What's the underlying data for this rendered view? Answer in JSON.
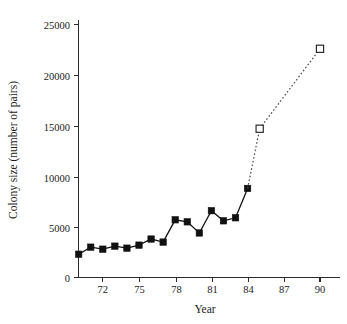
{
  "figure": {
    "background_color": "#ffffff",
    "axis_color": "#2b2b2b",
    "series_color": "#111111",
    "projected_color": "#4a4a4a"
  },
  "chart_data": {
    "type": "line",
    "title": "",
    "subtitle": "",
    "xlabel": "Year",
    "ylabel": "Colony size (number of pairs)",
    "xlim": [
      69.2,
      91.5
    ],
    "ylim": [
      0,
      26500
    ],
    "grid": false,
    "legend": null,
    "xticks": [
      72,
      75,
      78,
      81,
      84,
      87,
      90
    ],
    "xtick_labels": [
      "72",
      "75",
      "78",
      "81",
      "84",
      "87",
      "90"
    ],
    "yticks": [
      0,
      5000,
      10000,
      15000,
      20000,
      25000
    ],
    "ytick_labels": [
      "0",
      "5000",
      "10000",
      "15000",
      "20000",
      "25000"
    ],
    "series": [
      {
        "name": "Observed colony size",
        "marker": "filled-square",
        "linestyle": "solid",
        "x": [
          70,
          71,
          72,
          73,
          74,
          75,
          76,
          77,
          78,
          79,
          80,
          81,
          82,
          83,
          84
        ],
        "values": [
          2300,
          3000,
          2800,
          3100,
          2900,
          3200,
          3800,
          3500,
          5700,
          5500,
          4400,
          6600,
          5600,
          5900,
          8800
        ]
      },
      {
        "name": "Projected colony size",
        "marker": "open-square",
        "linestyle": "dotted",
        "x": [
          84,
          85,
          90
        ],
        "values": [
          8800,
          14700,
          22600
        ],
        "open_points": [
          85,
          90
        ]
      }
    ]
  }
}
